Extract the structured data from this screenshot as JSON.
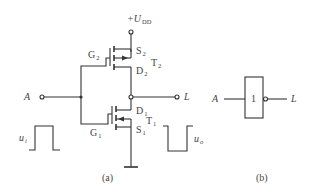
{
  "figure_a": {
    "caption": "(a)",
    "supply": {
      "prefix": "+",
      "symbol": "U",
      "subscript": "DD"
    },
    "input": {
      "label": "A"
    },
    "output": {
      "label": "L"
    },
    "transistor_top": {
      "name": "T",
      "name_sub": "2",
      "gate": "G",
      "gate_sub": "2",
      "source": "S",
      "source_sub": "2",
      "drain": "D",
      "drain_sub": "2"
    },
    "transistor_bottom": {
      "name": "T",
      "name_sub": "1",
      "gate": "G",
      "gate_sub": "1",
      "source": "S",
      "source_sub": "1",
      "drain": "D",
      "drain_sub": "1"
    },
    "input_waveform": {
      "symbol": "u",
      "subscript": "i",
      "shape": "positive-pulse"
    },
    "output_waveform": {
      "symbol": "u",
      "subscript": "o",
      "shape": "negative-pulse"
    }
  },
  "figure_b": {
    "caption": "(b)",
    "input": {
      "label": "A"
    },
    "output": {
      "label": "L"
    },
    "gate_symbol_text": "1"
  },
  "colors": {
    "line": "#333333",
    "text": "#444444",
    "background": "#ffffff"
  }
}
